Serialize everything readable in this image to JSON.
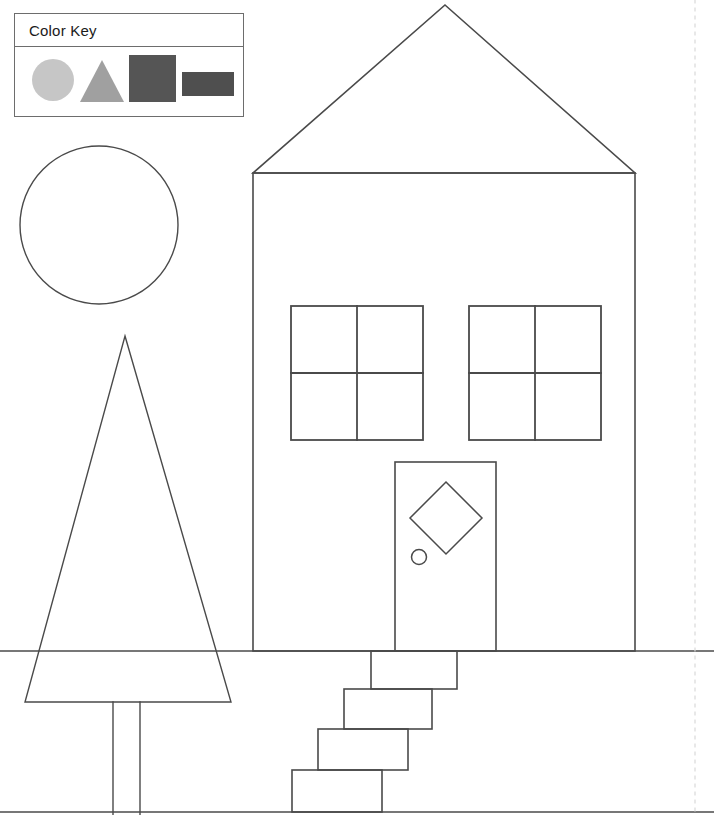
{
  "page": {
    "width": 714,
    "height": 815,
    "background_color": "#ffffff",
    "line_color": "#4a4a4a",
    "line_width": 1.6
  },
  "color_key": {
    "title": "Color Key",
    "border_color": "#6d6d6d",
    "items": [
      {
        "shape": "circle",
        "icon": "circle-swatch-icon",
        "color": "#c6c6c6"
      },
      {
        "shape": "triangle",
        "icon": "triangle-swatch-icon",
        "color": "#a0a0a0"
      },
      {
        "shape": "square",
        "icon": "square-swatch-icon",
        "color": "#555555"
      },
      {
        "shape": "rectangle",
        "icon": "rectangle-swatch-icon",
        "color": "#4f4f4f"
      }
    ]
  },
  "scene": {
    "ground_line": {
      "name": "ground-line",
      "y": 651,
      "x1": 0,
      "x2": 714
    },
    "bottom_border": {
      "name": "bottom-border-line",
      "y": 812,
      "x1": 0,
      "x2": 714
    },
    "margin_guide": {
      "name": "dashed-margin-guide",
      "x": 695,
      "y1": 0,
      "y2": 815,
      "color": "#d8d8d8",
      "dash": "3 5"
    },
    "sun": {
      "name": "sun-circle",
      "shape": "circle",
      "cx": 99,
      "cy": 225,
      "r": 79
    },
    "tree": {
      "name": "tree",
      "foliage": {
        "name": "tree-foliage-triangle",
        "shape": "triangle",
        "points": "125,336 231,702 25,702"
      },
      "trunk": {
        "name": "tree-trunk-rectangle",
        "shape": "rectangle",
        "x": 113,
        "y": 702,
        "width": 27,
        "height": 113
      }
    },
    "house": {
      "name": "house",
      "roof": {
        "name": "house-roof-triangle",
        "shape": "triangle",
        "points": "445,5 635,173 253,173"
      },
      "body": {
        "name": "house-body-rectangle",
        "shape": "rectangle",
        "x": 253,
        "y": 173,
        "width": 382,
        "height": 478
      },
      "windows": [
        {
          "name": "window-left",
          "shape": "square",
          "x": 291,
          "y": 306,
          "width": 132,
          "height": 134,
          "panes": 4
        },
        {
          "name": "window-right",
          "shape": "square",
          "x": 469,
          "y": 306,
          "width": 132,
          "height": 134,
          "panes": 4
        }
      ],
      "door": {
        "name": "door-rectangle",
        "shape": "rectangle",
        "x": 395,
        "y": 462,
        "width": 101,
        "height": 189,
        "window": {
          "name": "door-diamond-window",
          "shape": "diamond",
          "cx": 446,
          "cy": 518,
          "half_diagonal": 36
        },
        "knob": {
          "name": "door-knob-circle",
          "shape": "circle",
          "cx": 419,
          "cy": 557,
          "r": 7.5
        }
      },
      "steps": [
        {
          "name": "step-1-rectangle",
          "shape": "rectangle",
          "x": 371,
          "y": 651,
          "width": 86,
          "height": 38
        },
        {
          "name": "step-2-rectangle",
          "shape": "rectangle",
          "x": 344,
          "y": 689,
          "width": 88,
          "height": 40
        },
        {
          "name": "step-3-rectangle",
          "shape": "rectangle",
          "x": 318,
          "y": 729,
          "width": 90,
          "height": 41
        },
        {
          "name": "step-4-rectangle",
          "shape": "rectangle",
          "x": 292,
          "y": 770,
          "width": 90,
          "height": 42
        }
      ]
    }
  }
}
